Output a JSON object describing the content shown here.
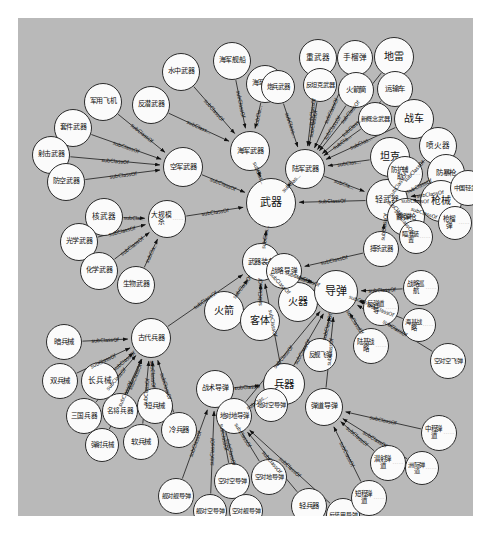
{
  "figure": {
    "kind": "ontology-graph",
    "relation_label": "subClassOf",
    "background_color": "#b9b9b9",
    "node_fill": "#fbfbfb",
    "node_stroke": "#2b2b2b",
    "edge_color": "#1a1a1a",
    "outer_background": "#ffffff"
  },
  "nodes": [
    {
      "id": "n0",
      "label": "武器",
      "x": 228,
      "y": 160,
      "r": 25,
      "fs": 11
    },
    {
      "id": "n1",
      "label": "空军武器",
      "x": 145,
      "y": 129,
      "r": 20,
      "fs": 7.2
    },
    {
      "id": "n2",
      "label": "海军武器",
      "x": 212,
      "y": 113,
      "r": 20,
      "fs": 7.2
    },
    {
      "id": "n3",
      "label": "陆军武器",
      "x": 267,
      "y": 131,
      "r": 20,
      "fs": 7.2
    },
    {
      "id": "n4",
      "label": "轻武器",
      "x": 348,
      "y": 161,
      "r": 21,
      "fs": 8
    },
    {
      "id": "n5",
      "label": "军用飞机",
      "x": 66,
      "y": 65,
      "r": 19,
      "fs": 7
    },
    {
      "id": "n6",
      "label": "套件武器",
      "x": 36,
      "y": 91,
      "r": 19,
      "fs": 7
    },
    {
      "id": "n7",
      "label": "射击武器",
      "x": 14,
      "y": 118,
      "r": 19,
      "fs": 7
    },
    {
      "id": "n8",
      "label": "防空武器",
      "x": 29,
      "y": 145,
      "r": 19,
      "fs": 7
    },
    {
      "id": "n9",
      "label": "反潜武器",
      "x": 114,
      "y": 68,
      "r": 19,
      "fs": 7
    },
    {
      "id": "n10",
      "label": "水中武器",
      "x": 144,
      "y": 35,
      "r": 19,
      "fs": 7
    },
    {
      "id": "n11",
      "label": "海军舰船",
      "x": 195,
      "y": 24,
      "r": 19,
      "fs": 7
    },
    {
      "id": "n12",
      "label": "海军枪炮",
      "x": 228,
      "y": 47,
      "r": 19,
      "fs": 7
    },
    {
      "id": "n13",
      "label": "炮兵武器",
      "x": 243,
      "y": 52,
      "r": 17,
      "fs": 6.4
    },
    {
      "id": "n14",
      "label": "重武器",
      "x": 281,
      "y": 21,
      "r": 19,
      "fs": 7.6
    },
    {
      "id": "n15",
      "label": "反坦克武器",
      "x": 285,
      "y": 50,
      "r": 17,
      "fs": 6.2
    },
    {
      "id": "n16",
      "label": "手榴弹",
      "x": 319,
      "y": 22,
      "r": 18,
      "fs": 7.6
    },
    {
      "id": "n17",
      "label": "地雷",
      "x": 356,
      "y": 19,
      "r": 20,
      "fs": 10
    },
    {
      "id": "n18",
      "label": "火箭筒",
      "x": 320,
      "y": 54,
      "r": 18,
      "fs": 7.4
    },
    {
      "id": "n19",
      "label": "运输车",
      "x": 359,
      "y": 53,
      "r": 18,
      "fs": 7.4
    },
    {
      "id": "n20",
      "label": "新概念武器",
      "x": 340,
      "y": 84,
      "r": 17,
      "fs": 6.2
    },
    {
      "id": "n21",
      "label": "战车",
      "x": 376,
      "y": 81,
      "r": 20,
      "fs": 10
    },
    {
      "id": "n22",
      "label": "坦克",
      "x": 352,
      "y": 119,
      "r": 20,
      "fs": 10
    },
    {
      "id": "n23",
      "label": "喷火器",
      "x": 401,
      "y": 109,
      "r": 19,
      "fs": 7.6
    },
    {
      "id": "n24",
      "label": "防护辅助",
      "x": 369,
      "y": 138,
      "r": 18,
      "fs": 6.4,
      "dots": true
    },
    {
      "id": "n25",
      "label": "防暴枪",
      "x": 409,
      "y": 136,
      "r": 19,
      "fs": 7.4
    },
    {
      "id": "n26",
      "label": "枪械",
      "x": 402,
      "y": 162,
      "r": 21,
      "fs": 10
    },
    {
      "id": "n27",
      "label": "中国轻武器",
      "x": 432,
      "y": 152,
      "r": 18,
      "fs": 6.2
    },
    {
      "id": "n28",
      "label": "霰弹枪",
      "x": 369,
      "y": 180,
      "r": 19,
      "fs": 7.4
    },
    {
      "id": "n29",
      "label": "枪榴弹",
      "x": 420,
      "y": 188,
      "r": 17,
      "fs": 6.6,
      "dots": true
    },
    {
      "id": "n30",
      "label": "瞄准装置",
      "x": 381,
      "y": 202,
      "r": 17,
      "fs": 6.2,
      "dots": true
    },
    {
      "id": "n31",
      "label": "搏杀武器",
      "x": 345,
      "y": 213,
      "r": 18,
      "fs": 6.4
    },
    {
      "id": "n32",
      "label": "核武器",
      "x": 67,
      "y": 180,
      "r": 19,
      "fs": 7.6
    },
    {
      "id": "n33",
      "label": "光学武器",
      "x": 42,
      "y": 205,
      "r": 19,
      "fs": 7
    },
    {
      "id": "n34",
      "label": "化学武器",
      "x": 62,
      "y": 234,
      "r": 19,
      "fs": 7
    },
    {
      "id": "n35",
      "label": "生物武器",
      "x": 99,
      "y": 248,
      "r": 19,
      "fs": 7
    },
    {
      "id": "n36",
      "label": "大规模杀",
      "x": 130,
      "y": 182,
      "r": 19,
      "fs": 6.8,
      "dots": true
    },
    {
      "id": "n37",
      "label": "武器装备",
      "x": 224,
      "y": 225,
      "r": 19,
      "fs": 7.2
    },
    {
      "id": "n38",
      "label": "火箭",
      "x": 186,
      "y": 273,
      "r": 20,
      "fs": 10
    },
    {
      "id": "n39",
      "label": "客体",
      "x": 222,
      "y": 283,
      "r": 20,
      "fs": 10
    },
    {
      "id": "n40",
      "label": "火器",
      "x": 260,
      "y": 264,
      "r": 20,
      "fs": 10
    },
    {
      "id": "n41",
      "label": "导弹",
      "x": 296,
      "y": 252,
      "r": 22,
      "fs": 11
    },
    {
      "id": "n42",
      "label": "兵器",
      "x": 245,
      "y": 345,
      "r": 21,
      "fs": 10.5
    },
    {
      "id": "n43",
      "label": "战术导弹",
      "x": 178,
      "y": 352,
      "r": 19,
      "fs": 7
    },
    {
      "id": "n44",
      "label": "古代兵器",
      "x": 113,
      "y": 300,
      "r": 20,
      "fs": 7.2
    },
    {
      "id": "n45",
      "label": "暗兵械",
      "x": 28,
      "y": 306,
      "r": 18,
      "fs": 7.4
    },
    {
      "id": "n46",
      "label": "长兵械",
      "x": 63,
      "y": 344,
      "r": 19,
      "fs": 7.6
    },
    {
      "id": "n47",
      "label": "双兵械",
      "x": 24,
      "y": 345,
      "r": 18,
      "fs": 7.4
    },
    {
      "id": "n48",
      "label": "三国兵器",
      "x": 48,
      "y": 380,
      "r": 18,
      "fs": 6.6
    },
    {
      "id": "n49",
      "label": "名将兵器",
      "x": 84,
      "y": 375,
      "r": 18,
      "fs": 6.6
    },
    {
      "id": "n50",
      "label": "短兵械",
      "x": 119,
      "y": 370,
      "r": 18,
      "fs": 7.4
    },
    {
      "id": "n51",
      "label": "弹射兵械",
      "x": 67,
      "y": 410,
      "r": 17,
      "fs": 6.4
    },
    {
      "id": "n52",
      "label": "软兵械",
      "x": 105,
      "y": 406,
      "r": 18,
      "fs": 7.4
    },
    {
      "id": "n53",
      "label": "冷兵器",
      "x": 143,
      "y": 394,
      "r": 18,
      "fs": 7.4
    },
    {
      "id": "n54",
      "label": "舰对舰导弹",
      "x": 140,
      "y": 460,
      "r": 18,
      "fs": 6.2
    },
    {
      "id": "n55",
      "label": "舰对空导弹",
      "x": 175,
      "y": 476,
      "r": 17,
      "fs": 6
    },
    {
      "id": "n56",
      "label": "空对空导弹",
      "x": 196,
      "y": 445,
      "r": 18,
      "fs": 6.2
    },
    {
      "id": "n57",
      "label": "空对舰导弹",
      "x": 211,
      "y": 476,
      "r": 17,
      "fs": 6
    },
    {
      "id": "n58",
      "label": "空对地导弹",
      "x": 233,
      "y": 441,
      "r": 18,
      "fs": 6.2
    },
    {
      "id": "n59",
      "label": "轻兵器",
      "x": 273,
      "y": 470,
      "r": 18,
      "fs": 7.4
    },
    {
      "id": "n60",
      "label": "反装甲导弹",
      "x": 308,
      "y": 480,
      "r": 17,
      "fs": 6
    },
    {
      "id": "n61",
      "label": "地对地导弹",
      "x": 198,
      "y": 380,
      "r": 18,
      "fs": 6.4
    },
    {
      "id": "n62",
      "label": "地对空导弹",
      "x": 236,
      "y": 370,
      "r": 17,
      "fs": 6.2
    },
    {
      "id": "n63",
      "label": "弹道导弹",
      "x": 287,
      "y": 370,
      "r": 19,
      "fs": 7
    },
    {
      "id": "n64",
      "label": "反舰飞弹",
      "x": 285,
      "y": 320,
      "r": 17,
      "fs": 6.4
    },
    {
      "id": "n65",
      "label": "陆基战略",
      "x": 335,
      "y": 310,
      "r": 18,
      "fs": 6.4,
      "dots": true
    },
    {
      "id": "n66",
      "label": "反弹道导",
      "x": 345,
      "y": 272,
      "r": 18,
      "fs": 6.4,
      "dots": true
    },
    {
      "id": "n67",
      "label": "战略巡航",
      "x": 385,
      "y": 252,
      "r": 18,
      "fs": 6.4,
      "dots": true
    },
    {
      "id": "n68",
      "label": "海基战略",
      "x": 384,
      "y": 290,
      "r": 17,
      "fs": 6.2,
      "dots": true
    },
    {
      "id": "n69",
      "label": "空对空飞弹",
      "x": 412,
      "y": 325,
      "r": 18,
      "fs": 6.2
    },
    {
      "id": "n70",
      "label": "中程弹道",
      "x": 403,
      "y": 397,
      "r": 18,
      "fs": 6.4,
      "dots": true
    },
    {
      "id": "n71",
      "label": "潜射弹道",
      "x": 352,
      "y": 427,
      "r": 18,
      "fs": 6.4,
      "dots": true
    },
    {
      "id": "n72",
      "label": "洲际弹道",
      "x": 387,
      "y": 433,
      "r": 17,
      "fs": 6.2,
      "dots": true
    },
    {
      "id": "n73",
      "label": "短程弹道",
      "x": 333,
      "y": 462,
      "r": 18,
      "fs": 6.4,
      "dots": true
    },
    {
      "id": "n74",
      "label": "战略导弹",
      "x": 248,
      "y": 235,
      "r": 18,
      "fs": 6.6
    }
  ],
  "edges": [
    {
      "from": "n1",
      "to": "n0",
      "label": "subClassOf"
    },
    {
      "from": "n2",
      "to": "n0",
      "label": "subClas..."
    },
    {
      "from": "n3",
      "to": "n0",
      "label": "subClas..."
    },
    {
      "from": "n4",
      "to": "n0",
      "label": "subClassOf"
    },
    {
      "from": "n37",
      "to": "n0",
      "label": "subClas..."
    },
    {
      "from": "n36",
      "to": "n0",
      "label": "subClassOf"
    },
    {
      "from": "n5",
      "to": "n1",
      "label": "subClassOf"
    },
    {
      "from": "n6",
      "to": "n1",
      "label": "subClassOf"
    },
    {
      "from": "n7",
      "to": "n1",
      "label": "subClassOf"
    },
    {
      "from": "n8",
      "to": "n1",
      "label": "subClassOf"
    },
    {
      "from": "n9",
      "to": "n2",
      "label": "subClass..."
    },
    {
      "from": "n10",
      "to": "n2",
      "label": "subClassOf"
    },
    {
      "from": "n11",
      "to": "n2",
      "label": "subClassOf"
    },
    {
      "from": "n12",
      "to": "n2",
      "label": "subCla..."
    },
    {
      "from": "n13",
      "to": "n3",
      "label": "subClass..."
    },
    {
      "from": "n14",
      "to": "n3",
      "label": "subClassOf"
    },
    {
      "from": "n15",
      "to": "n3",
      "label": "subClassOf"
    },
    {
      "from": "n16",
      "to": "n3",
      "label": "subClassOf"
    },
    {
      "from": "n17",
      "to": "n3",
      "label": "subClassOf"
    },
    {
      "from": "n18",
      "to": "n3",
      "label": "subClassOf"
    },
    {
      "from": "n19",
      "to": "n3",
      "label": "subClass..."
    },
    {
      "from": "n20",
      "to": "n3",
      "label": "subCla..."
    },
    {
      "from": "n21",
      "to": "n3",
      "label": "subClas..."
    },
    {
      "from": "n22",
      "to": "n3",
      "label": "subClas..."
    },
    {
      "from": "n3",
      "to": "n4",
      "label": "subCla..."
    },
    {
      "from": "n23",
      "to": "n4",
      "label": "subClassOf"
    },
    {
      "from": "n24",
      "to": "n4",
      "label": "subClassOf"
    },
    {
      "from": "n25",
      "to": "n4",
      "label": "subClassOf"
    },
    {
      "from": "n26",
      "to": "n4",
      "label": "subClassOf"
    },
    {
      "from": "n27",
      "to": "n4",
      "label": "subClassOf"
    },
    {
      "from": "n28",
      "to": "n4",
      "label": "subClassOf"
    },
    {
      "from": "n29",
      "to": "n4",
      "label": "subClassOf"
    },
    {
      "from": "n30",
      "to": "n4",
      "label": "subClassOf"
    },
    {
      "from": "n31",
      "to": "n4",
      "label": "subClassOf"
    },
    {
      "from": "n32",
      "to": "n36",
      "label": "subCla..."
    },
    {
      "from": "n33",
      "to": "n36",
      "label": "subClassOf"
    },
    {
      "from": "n34",
      "to": "n36",
      "label": "subClassOf"
    },
    {
      "from": "n35",
      "to": "n36",
      "label": "subCla..."
    },
    {
      "from": "n38",
      "to": "n37",
      "label": "subClassOf"
    },
    {
      "from": "n39",
      "to": "n37",
      "label": "subClassOf"
    },
    {
      "from": "n40",
      "to": "n37",
      "label": "subClassOf"
    },
    {
      "from": "n41",
      "to": "n37",
      "label": "subClassOf"
    },
    {
      "from": "n42",
      "to": "n37",
      "label": "subClassOf"
    },
    {
      "from": "n44",
      "to": "n37",
      "label": "subClassOf"
    },
    {
      "from": "n43",
      "to": "n42",
      "label": "subClassO"
    },
    {
      "from": "n45",
      "to": "n44",
      "label": "subClassOf"
    },
    {
      "from": "n46",
      "to": "n44",
      "label": "subClassOf"
    },
    {
      "from": "n47",
      "to": "n44",
      "label": "subClassOf"
    },
    {
      "from": "n48",
      "to": "n44",
      "label": "subClassOf"
    },
    {
      "from": "n49",
      "to": "n44",
      "label": "subClassOf"
    },
    {
      "from": "n50",
      "to": "n44",
      "label": "subClassOf"
    },
    {
      "from": "n51",
      "to": "n44",
      "label": "subClassOf"
    },
    {
      "from": "n52",
      "to": "n44",
      "label": "subClassOf"
    },
    {
      "from": "n53",
      "to": "n44",
      "label": "subClassOf"
    },
    {
      "from": "n54",
      "to": "n43",
      "label": "subClassOf"
    },
    {
      "from": "n55",
      "to": "n43",
      "label": "subClassOf"
    },
    {
      "from": "n56",
      "to": "n43",
      "label": "subClassOf"
    },
    {
      "from": "n57",
      "to": "n43",
      "label": "subClassOf"
    },
    {
      "from": "n58",
      "to": "n43",
      "label": "subClassOf"
    },
    {
      "from": "n61",
      "to": "n42",
      "label": "subClas..."
    },
    {
      "from": "n59",
      "to": "n61",
      "label": "subClassOf"
    },
    {
      "from": "n60",
      "to": "n61",
      "label": "subClassOf"
    },
    {
      "from": "n61",
      "to": "n41",
      "label": "subClassOf"
    },
    {
      "from": "n62",
      "to": "n41",
      "label": "subClassOf"
    },
    {
      "from": "n63",
      "to": "n41",
      "label": "subClassOf"
    },
    {
      "from": "n64",
      "to": "n41",
      "label": "subClassOf"
    },
    {
      "from": "n65",
      "to": "n41",
      "label": "subClassOf"
    },
    {
      "from": "n66",
      "to": "n41",
      "label": "subClassOf"
    },
    {
      "from": "n67",
      "to": "n41",
      "label": "subClassOf"
    },
    {
      "from": "n68",
      "to": "n41",
      "label": "subClassOf"
    },
    {
      "from": "n69",
      "to": "n41",
      "label": "subClassOf"
    },
    {
      "from": "n74",
      "to": "n41",
      "label": "subClassOf"
    },
    {
      "from": "n31",
      "to": "n74",
      "label": "subClassOf"
    },
    {
      "from": "n70",
      "to": "n63",
      "label": "subClassOf"
    },
    {
      "from": "n71",
      "to": "n63",
      "label": "subClassOf"
    },
    {
      "from": "n72",
      "to": "n63",
      "label": "subClassOf"
    },
    {
      "from": "n73",
      "to": "n63",
      "label": "subClassOf"
    }
  ]
}
